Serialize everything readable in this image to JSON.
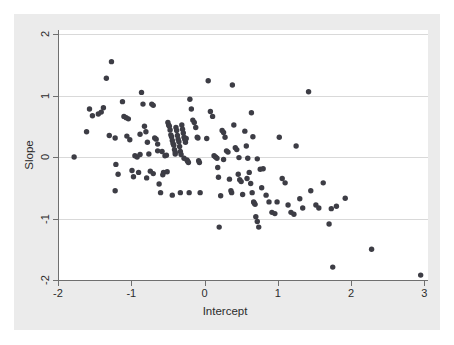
{
  "figure": {
    "background_color": "#ffffff",
    "graph_region_color": "#ebebeb",
    "plot_region_color": "#ffffff",
    "marker_color": "#3d3d45",
    "gridline_color": "#d9d9d9",
    "axis_color": "#6f6f6f"
  },
  "chart_data": {
    "type": "scatter",
    "title": "",
    "xlabel": "Intercept",
    "ylabel": "Slope",
    "xlim": [
      -2.0,
      3.05
    ],
    "ylim": [
      -2.0,
      2.0
    ],
    "xticks": [
      -2,
      -1,
      0,
      1,
      2,
      3
    ],
    "xticklabels": [
      "-2",
      "-1",
      "0",
      "1",
      "2",
      "3"
    ],
    "yticks": [
      -2,
      -1,
      0,
      1,
      2
    ],
    "yticklabels": [
      "-2",
      "-1",
      "0",
      "1",
      "2"
    ],
    "grid": "horizontal",
    "gridlines_y": [
      -1,
      0,
      1,
      2
    ],
    "legend": null,
    "marker": "filled-circle",
    "marker_size": 5.4,
    "n_points": 166,
    "points": [
      [
        -1.78,
        0.0
      ],
      [
        -1.57,
        0.78
      ],
      [
        -1.53,
        0.67
      ],
      [
        -1.61,
        0.41
      ],
      [
        -1.41,
        0.73
      ],
      [
        -1.38,
        0.8
      ],
      [
        -1.34,
        1.28
      ],
      [
        -1.27,
        1.55
      ],
      [
        -1.3,
        0.35
      ],
      [
        -1.22,
        0.31
      ],
      [
        -1.21,
        -0.12
      ],
      [
        -1.18,
        -0.28
      ],
      [
        -1.22,
        -0.55
      ],
      [
        -1.12,
        0.9
      ],
      [
        -1.1,
        0.66
      ],
      [
        -1.07,
        0.64
      ],
      [
        -1.06,
        0.34
      ],
      [
        -1.02,
        0.28
      ],
      [
        -0.99,
        -0.22
      ],
      [
        -0.97,
        -0.32
      ],
      [
        -0.95,
        0.02
      ],
      [
        -0.92,
        0.0
      ],
      [
        -0.9,
        -0.25
      ],
      [
        -0.88,
        0.37
      ],
      [
        -0.86,
        1.05
      ],
      [
        -0.84,
        0.86
      ],
      [
        -0.82,
        0.5
      ],
      [
        -0.8,
        0.41
      ],
      [
        -0.78,
        0.24
      ],
      [
        -0.76,
        0.05
      ],
      [
        -0.74,
        -0.23
      ],
      [
        -0.72,
        0.86
      ],
      [
        -0.7,
        0.84
      ],
      [
        -0.68,
        0.31
      ],
      [
        -0.66,
        0.29
      ],
      [
        -0.64,
        0.21
      ],
      [
        -0.62,
        -0.44
      ],
      [
        -0.6,
        -0.58
      ],
      [
        -0.58,
        0.09
      ],
      [
        -0.56,
        -0.25
      ],
      [
        -0.54,
        0.02
      ],
      [
        -0.52,
        0.03
      ],
      [
        -0.51,
        -0.24
      ],
      [
        -0.5,
        0.56
      ],
      [
        -0.49,
        0.52
      ],
      [
        -0.48,
        0.5
      ],
      [
        -0.47,
        0.44
      ],
      [
        -0.46,
        0.36
      ],
      [
        -0.45,
        0.33
      ],
      [
        -0.44,
        0.27
      ],
      [
        -0.43,
        0.22
      ],
      [
        -0.42,
        0.19
      ],
      [
        -0.41,
        0.12
      ],
      [
        -0.4,
        0.08
      ],
      [
        -0.4,
        0.05
      ],
      [
        -0.39,
        0.48
      ],
      [
        -0.38,
        0.43
      ],
      [
        -0.37,
        0.35
      ],
      [
        -0.36,
        0.29
      ],
      [
        -0.35,
        0.25
      ],
      [
        -0.34,
        0.17
      ],
      [
        -0.33,
        0.09
      ],
      [
        -0.32,
        0.04
      ],
      [
        -0.31,
        0.52
      ],
      [
        -0.3,
        0.45
      ],
      [
        -0.29,
        0.39
      ],
      [
        -0.28,
        0.32
      ],
      [
        -0.27,
        0.29
      ],
      [
        -0.26,
        0.24
      ],
      [
        -0.25,
        0.3
      ],
      [
        -0.24,
        -0.05
      ],
      [
        -0.23,
        -0.07
      ],
      [
        -0.22,
        -0.09
      ],
      [
        -0.21,
        -0.58
      ],
      [
        -0.2,
        0.94
      ],
      [
        -0.18,
        0.78
      ],
      [
        -0.16,
        0.6
      ],
      [
        -0.14,
        0.56
      ],
      [
        -0.12,
        0.48
      ],
      [
        -0.1,
        0.32
      ],
      [
        -0.09,
        0.31
      ],
      [
        -0.08,
        -0.06
      ],
      [
        -0.07,
        -0.09
      ],
      [
        -0.06,
        -0.58
      ],
      [
        -0.33,
        -0.58
      ],
      [
        -0.44,
        -0.62
      ],
      [
        -0.57,
        -0.29
      ],
      [
        -0.7,
        -0.27
      ],
      [
        -0.79,
        -0.34
      ],
      [
        0.03,
        0.3
      ],
      [
        0.05,
        1.24
      ],
      [
        0.08,
        0.74
      ],
      [
        0.11,
        0.66
      ],
      [
        0.13,
        0.02
      ],
      [
        0.15,
        0.0
      ],
      [
        0.17,
        -0.02
      ],
      [
        0.18,
        -0.17
      ],
      [
        0.19,
        -0.33
      ],
      [
        0.2,
        -1.14
      ],
      [
        0.22,
        -0.63
      ],
      [
        0.24,
        0.43
      ],
      [
        0.26,
        0.4
      ],
      [
        0.28,
        0.32
      ],
      [
        0.3,
        0.1
      ],
      [
        0.32,
        0.08
      ],
      [
        0.34,
        -0.36
      ],
      [
        0.36,
        -0.55
      ],
      [
        0.37,
        -0.58
      ],
      [
        0.38,
        1.17
      ],
      [
        0.4,
        0.52
      ],
      [
        0.42,
        0.15
      ],
      [
        0.44,
        0.12
      ],
      [
        0.46,
        -0.28
      ],
      [
        0.48,
        -0.37
      ],
      [
        0.5,
        -0.4
      ],
      [
        0.52,
        -0.61
      ],
      [
        0.55,
        0.42
      ],
      [
        0.57,
        0.18
      ],
      [
        0.59,
        -0.02
      ],
      [
        0.61,
        -0.25
      ],
      [
        0.63,
        -0.43
      ],
      [
        0.65,
        -0.58
      ],
      [
        0.67,
        -0.73
      ],
      [
        0.68,
        -0.75
      ],
      [
        0.69,
        -0.77
      ],
      [
        0.7,
        -0.97
      ],
      [
        0.72,
        -1.05
      ],
      [
        0.74,
        -1.14
      ],
      [
        0.64,
        0.72
      ],
      [
        0.66,
        0.33
      ],
      [
        0.72,
        -0.03
      ],
      [
        0.76,
        -0.2
      ],
      [
        0.78,
        -0.5
      ],
      [
        0.8,
        -0.19
      ],
      [
        0.84,
        -0.62
      ],
      [
        0.88,
        -0.73
      ],
      [
        0.92,
        -0.9
      ],
      [
        0.96,
        -0.92
      ],
      [
        0.99,
        -0.73
      ],
      [
        1.02,
        0.32
      ],
      [
        1.06,
        -0.35
      ],
      [
        1.1,
        -0.42
      ],
      [
        1.14,
        -0.78
      ],
      [
        1.18,
        -0.9
      ],
      [
        1.22,
        -0.93
      ],
      [
        1.25,
        0.18
      ],
      [
        1.3,
        -0.68
      ],
      [
        1.34,
        -0.83
      ],
      [
        1.42,
        1.06
      ],
      [
        1.45,
        -0.55
      ],
      [
        1.52,
        -0.78
      ],
      [
        1.56,
        -0.83
      ],
      [
        1.62,
        -0.42
      ],
      [
        1.7,
        -1.09
      ],
      [
        1.73,
        -0.84
      ],
      [
        1.75,
        -1.79
      ],
      [
        1.8,
        -0.8
      ],
      [
        1.92,
        -0.67
      ],
      [
        2.28,
        -1.5
      ],
      [
        2.95,
        -1.92
      ],
      [
        -1.45,
        0.7
      ],
      [
        -1.04,
        0.62
      ],
      [
        -0.88,
        0.04
      ],
      [
        -0.64,
        0.1
      ],
      [
        -0.28,
        -0.02
      ],
      [
        0.26,
        -0.04
      ],
      [
        0.47,
        -0.01
      ],
      [
        0.58,
        -0.35
      ]
    ]
  },
  "axis_titles": {
    "x": "Intercept",
    "y": "Slope"
  }
}
